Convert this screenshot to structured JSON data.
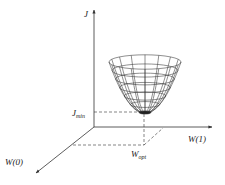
{
  "diagram": {
    "title": "",
    "axes": {
      "vertical": "J",
      "horizontal_right": "W(1)",
      "diagonal": "W(0)"
    },
    "labels": {
      "j_min_main": "J",
      "j_min_sub": "min",
      "w_opt_main": "W",
      "w_opt_sub": "opt"
    },
    "surface": "paraboloid-wireframe",
    "colors": {
      "ink": "#222222",
      "background": "#ffffff"
    }
  }
}
